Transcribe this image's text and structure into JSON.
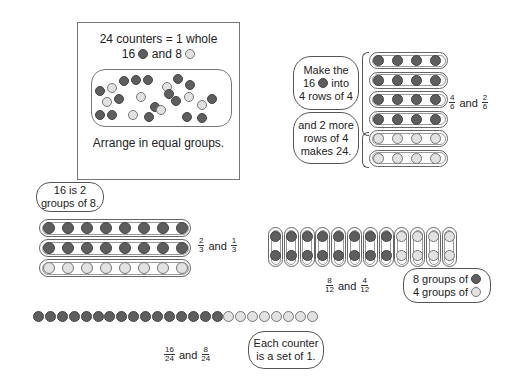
{
  "colors": {
    "dark_counter": "#5e5e5e",
    "light_counter": "#e2e2e2",
    "outline": "#666666"
  },
  "intro_box": {
    "line1": "24 counters = 1 whole",
    "line2_prefix": "16",
    "line2_mid": "and 8",
    "caption": "Arrange in equal groups.",
    "dark_count": 16,
    "light_count": 8
  },
  "sixths": {
    "cloud1": [
      "Make the",
      "16",
      "into",
      "4 rows of 4"
    ],
    "cloud2": [
      "and 2 more",
      "rows of 4",
      "makes 24."
    ],
    "rows": [
      [
        "dark",
        "dark",
        "dark",
        "dark"
      ],
      [
        "dark",
        "dark",
        "dark",
        "dark"
      ],
      [
        "dark",
        "dark",
        "dark",
        "dark"
      ],
      [
        "dark",
        "dark",
        "dark",
        "dark"
      ],
      [
        "light",
        "light",
        "light",
        "light"
      ],
      [
        "light",
        "light",
        "light",
        "light"
      ]
    ],
    "fraction_a": {
      "num": "4",
      "den": "6"
    },
    "joiner": "and",
    "fraction_b": {
      "num": "2",
      "den": "6"
    }
  },
  "thirds": {
    "cloud": [
      "16 is 2",
      "groups of 8."
    ],
    "rows": [
      "dark",
      "dark",
      "light"
    ],
    "per_row": 8,
    "fraction_a": {
      "num": "2",
      "den": "3"
    },
    "joiner": "and",
    "fraction_b": {
      "num": "1",
      "den": "3"
    }
  },
  "twelfths": {
    "columns": [
      "dark",
      "dark",
      "dark",
      "dark",
      "dark",
      "dark",
      "dark",
      "dark",
      "light",
      "light",
      "light",
      "light"
    ],
    "fraction_a": {
      "num": "8",
      "den": "12"
    },
    "joiner": "and",
    "fraction_b": {
      "num": "4",
      "den": "12"
    },
    "cloud_line1": "8 groups of",
    "cloud_line2": "4 groups of"
  },
  "twentyfourths": {
    "dark": 16,
    "light": 8,
    "fraction_a": {
      "num": "16",
      "den": "24"
    },
    "joiner": "and",
    "fraction_b": {
      "num": "8",
      "den": "24"
    },
    "cloud": [
      "Each counter",
      "is a set of 1."
    ]
  }
}
